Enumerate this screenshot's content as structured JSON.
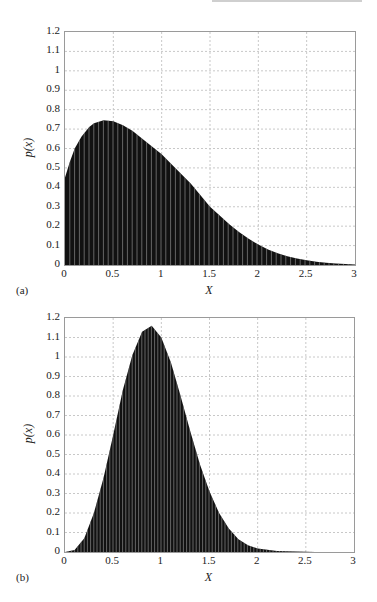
{
  "chart_data": [
    {
      "type": "area",
      "panel_label": "(a)",
      "title": "",
      "xlabel": "X",
      "ylabel": "p(x)",
      "xlim": [
        0,
        3
      ],
      "ylim": [
        0,
        1.2
      ],
      "grid": true,
      "render": "dense vertical bars (histogram-like fill) with white separators",
      "x_ticks": [
        "0",
        "0.5",
        "1",
        "1.5",
        "2",
        "2.5",
        "3"
      ],
      "y_ticks": [
        "0",
        "0.1",
        "0.2",
        "0.3",
        "0.4",
        "0.5",
        "0.6",
        "0.7",
        "0.8",
        "0.9",
        "1",
        "1.1",
        "1.2"
      ],
      "x": [
        0.0,
        0.05,
        0.1,
        0.17,
        0.25,
        0.3,
        0.4,
        0.5,
        0.6,
        0.7,
        0.8,
        0.9,
        1.0,
        1.1,
        1.2,
        1.3,
        1.4,
        1.5,
        1.6,
        1.7,
        1.8,
        1.9,
        2.0,
        2.1,
        2.2,
        2.3,
        2.4,
        2.5,
        2.6,
        2.7,
        2.8,
        2.9,
        3.0
      ],
      "values": [
        0.45,
        0.53,
        0.6,
        0.66,
        0.71,
        0.73,
        0.745,
        0.74,
        0.72,
        0.69,
        0.65,
        0.61,
        0.57,
        0.52,
        0.47,
        0.42,
        0.36,
        0.3,
        0.255,
        0.21,
        0.17,
        0.135,
        0.105,
        0.08,
        0.06,
        0.045,
        0.033,
        0.024,
        0.017,
        0.012,
        0.008,
        0.005,
        0.003
      ]
    },
    {
      "type": "area",
      "panel_label": "(b)",
      "title": "",
      "xlabel": "X",
      "ylabel": "p(x)",
      "xlim": [
        0,
        3
      ],
      "ylim": [
        0,
        1.2
      ],
      "grid": true,
      "render": "dense vertical bars (histogram-like fill) with white separators",
      "x_ticks": [
        "0",
        "0.5",
        "1",
        "1.5",
        "2",
        "2.5",
        "3"
      ],
      "y_ticks": [
        "0",
        "0.1",
        "0.2",
        "0.3",
        "0.4",
        "0.5",
        "0.6",
        "0.7",
        "0.8",
        "0.9",
        "1",
        "1.1",
        "1.2"
      ],
      "x": [
        0.0,
        0.1,
        0.2,
        0.3,
        0.4,
        0.5,
        0.6,
        0.7,
        0.8,
        0.9,
        1.0,
        1.1,
        1.2,
        1.3,
        1.4,
        1.5,
        1.6,
        1.7,
        1.8,
        1.9,
        2.0,
        2.2,
        2.4,
        2.6,
        2.8,
        3.0
      ],
      "values": [
        0.0,
        0.01,
        0.07,
        0.2,
        0.38,
        0.6,
        0.83,
        1.01,
        1.13,
        1.16,
        1.1,
        0.97,
        0.8,
        0.62,
        0.45,
        0.31,
        0.2,
        0.12,
        0.065,
        0.035,
        0.018,
        0.005,
        0.002,
        0.0,
        0.0,
        0.0
      ]
    }
  ],
  "colors": {
    "fill": "#111111",
    "separator": "#ffffff",
    "grid": "#c8c8c8",
    "frame": "#9a9a9a"
  }
}
